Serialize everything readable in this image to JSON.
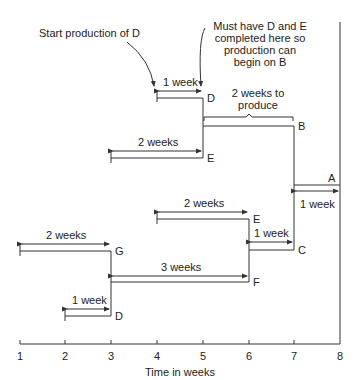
{
  "annotations": {
    "start_d": "Start production of D",
    "must_have_1": "Must have D and E",
    "must_have_2": "completed here so",
    "must_have_3": "production can",
    "must_have_4": "begin on B",
    "b_produce_1": "2 weeks to",
    "b_produce_2": "produce"
  },
  "bars": [
    {
      "id": "D_top",
      "label": "D",
      "duration": "1 week",
      "start": 4,
      "end": 5
    },
    {
      "id": "E_top",
      "label": "E",
      "duration": "2 weeks",
      "start": 3,
      "end": 5
    },
    {
      "id": "B",
      "label": "B",
      "duration": "2 weeks to produce",
      "start": 5,
      "end": 7
    },
    {
      "id": "A",
      "label": "A",
      "duration": "1 week",
      "start": 7,
      "end": 8
    },
    {
      "id": "E_low",
      "label": "E",
      "duration": "2 weeks",
      "start": 4,
      "end": 6
    },
    {
      "id": "C",
      "label": "C",
      "duration": "1 week",
      "start": 6,
      "end": 7
    },
    {
      "id": "G",
      "label": "G",
      "duration": "2 weeks",
      "start": 1,
      "end": 3
    },
    {
      "id": "F",
      "label": "F",
      "duration": "3 weeks",
      "start": 3,
      "end": 6
    },
    {
      "id": "D_low",
      "label": "D",
      "duration": "1 week",
      "start": 2,
      "end": 3
    }
  ],
  "axis": {
    "ticks": [
      "1",
      "2",
      "3",
      "4",
      "5",
      "6",
      "7",
      "8"
    ],
    "xlabel": "Time in weeks"
  }
}
